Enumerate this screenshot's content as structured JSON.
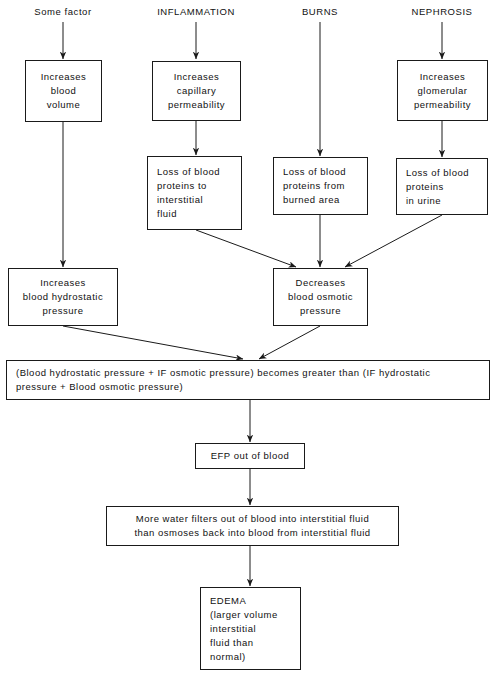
{
  "diagram": {
    "background": "#ffffff",
    "ink": "#1a1a1a",
    "sources": [
      {
        "id": "src-some-factor",
        "text": "Some factor"
      },
      {
        "id": "src-inflammation",
        "text": "INFLAMMATION"
      },
      {
        "id": "src-burns",
        "text": "BURNS"
      },
      {
        "id": "src-nephrosis",
        "text": "NEPHROSIS"
      }
    ],
    "nodes": {
      "increases_blood_volume": {
        "lines": [
          "Increases",
          "blood",
          "volume"
        ]
      },
      "increases_capillary_permeability": {
        "lines": [
          "Increases",
          "capillary",
          "permeability"
        ]
      },
      "increases_glomerular_permeability": {
        "lines": [
          "Increases",
          "glomerular",
          "permeability"
        ]
      },
      "loss_proteins_interstitial": {
        "lines": [
          "Loss of blood",
          "proteins to",
          "interstitial",
          "fluid"
        ]
      },
      "loss_proteins_burned": {
        "lines": [
          "Loss of blood",
          "proteins from",
          "burned area"
        ]
      },
      "loss_proteins_urine": {
        "lines": [
          "Loss of blood",
          "proteins",
          "in urine"
        ]
      },
      "increases_hydrostatic": {
        "lines": [
          "Increases",
          "blood hydrostatic",
          "pressure"
        ]
      },
      "decreases_osmotic": {
        "lines": [
          "Decreases",
          "blood osmotic",
          "pressure"
        ]
      },
      "pressure_equation": {
        "lines": [
          "(Blood hydrostatic pressure + IF osmotic pressure) becomes greater than (IF hydrostatic",
          "pressure + Blood osmotic pressure)"
        ]
      },
      "efp_out_of_blood": {
        "lines": [
          "EFP out of blood"
        ]
      },
      "more_water_filters": {
        "lines": [
          "More water filters out of blood into interstitial fluid",
          "than osmoses back into blood from interstitial fluid"
        ]
      },
      "edema": {
        "lines": [
          "EDEMA",
          "(larger volume",
          "interstitial",
          "fluid than",
          "normal)"
        ]
      }
    }
  }
}
